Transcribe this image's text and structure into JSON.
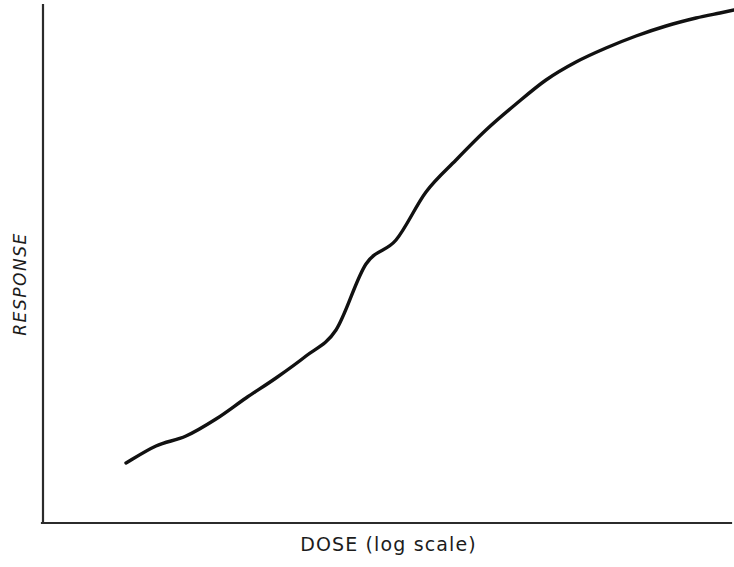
{
  "figure": {
    "width": 734,
    "height": 567,
    "background_color": "#ffffff"
  },
  "axes": {
    "line_color": "#2b2b2b",
    "line_width": 2,
    "origin_x": 43,
    "origin_y": 523,
    "x_axis_end": 731,
    "y_axis_top": 5,
    "ticks_shown": false,
    "gridlines_shown": false,
    "frame": "L-shape (left and bottom spines only)"
  },
  "curve": {
    "color": "#111111",
    "width": 3.4,
    "shape": "sigmoid"
  },
  "chart_data": {
    "type": "line",
    "title": "",
    "subtitle": "",
    "xlabel": "DOSE (log scale)",
    "ylabel": "RESPONSE",
    "xlabel_text": "DOSE (log scale)",
    "ylabel_text": "RESPONSE",
    "x_tick_labels": [],
    "y_tick_labels": [],
    "grid": false,
    "legend": null,
    "legend_position": "none",
    "annotations": [],
    "xlim": [
      0,
      10
    ],
    "ylim": [
      0,
      1
    ],
    "x_axis_scale": "log",
    "series": [
      {
        "name": "dose-response",
        "x": [
          1.2,
          1.6,
          2.0,
          2.4,
          2.8,
          3.2,
          3.6,
          4.0,
          4.4,
          4.8,
          5.2,
          5.6,
          6.0,
          6.4,
          6.8,
          7.2,
          7.6,
          8.0,
          8.4,
          8.8,
          9.2,
          9.6,
          10.0
        ],
        "y": [
          0.117,
          0.147,
          0.182,
          0.222,
          0.267,
          0.318,
          0.374,
          0.434,
          0.496,
          0.558,
          0.618,
          0.675,
          0.727,
          0.773,
          0.813,
          0.847,
          0.875,
          0.898,
          0.917,
          0.932,
          0.945,
          0.955,
          0.963
        ],
        "pixel_points": [
          [
            126,
            463
          ],
          [
            156,
            446
          ],
          [
            186,
            436
          ],
          [
            216,
            419
          ],
          [
            246,
            398
          ],
          [
            276,
            378
          ],
          [
            306,
            356
          ],
          [
            336,
            330
          ],
          [
            366,
            264
          ],
          [
            396,
            240
          ],
          [
            426,
            192
          ],
          [
            456,
            160
          ],
          [
            486,
            130
          ],
          [
            516,
            104
          ],
          [
            546,
            80
          ],
          [
            576,
            62
          ],
          [
            606,
            48
          ],
          [
            636,
            36
          ],
          [
            666,
            26
          ],
          [
            696,
            18
          ],
          [
            720,
            13
          ],
          [
            734,
            10
          ]
        ]
      }
    ]
  },
  "labels": {
    "x_axis": "DOSE (log scale)",
    "y_axis": "RESPONSE"
  }
}
